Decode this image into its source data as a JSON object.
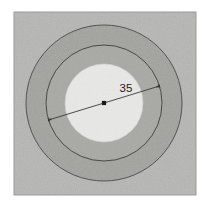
{
  "figure": {
    "canvas": {
      "width": 208,
      "height": 209,
      "background": "#ffffff"
    },
    "plate": {
      "name": "gray-photo-plate",
      "x": 14,
      "y": 12,
      "width": 182,
      "height": 183,
      "fill": "#b6b6b4",
      "border_color": "#9a9a98"
    },
    "center": {
      "x": 104,
      "y": 103
    },
    "rings": [
      {
        "name": "outer-circle",
        "radius": 78,
        "fill": "#a2a29f",
        "stroke": "#4a4a48",
        "stroke_width": 0.9
      },
      {
        "name": "middle-circle",
        "radius": 58,
        "fill": "#a8a8a5",
        "stroke": "#3d3d3b",
        "stroke_width": 0.9
      },
      {
        "name": "inner-disc",
        "radius": 39,
        "fill": "#e8e8e6",
        "stroke": "#d2d2cf",
        "stroke_width": 0.6
      }
    ],
    "dimension": {
      "name": "diameter-dimension",
      "label": "35",
      "label_x": 126,
      "label_y": 92,
      "angle_deg": -17,
      "line_color": "#3a3a38",
      "line_width": 0.9,
      "start": {
        "x": 48.5,
        "y": 120.0
      },
      "end": {
        "x": 159.5,
        "y": 86.0
      },
      "arrowheads": "both",
      "center_marker": {
        "name": "center-point-marker",
        "x": 104,
        "y": 103,
        "size": 4.2,
        "color": "#1a1a18"
      }
    },
    "texture": {
      "name": "grain-texture",
      "enabled": true,
      "opacity": 0.35
    }
  }
}
